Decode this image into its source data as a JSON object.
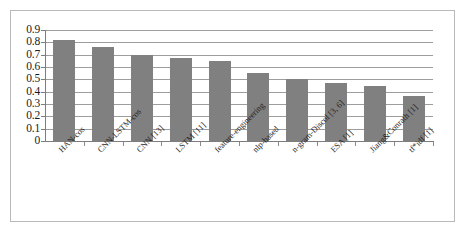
{
  "chart_data": {
    "type": "bar",
    "title": "",
    "subtitle": "",
    "xlabel": "",
    "ylabel": "",
    "ylim": [
      0,
      0.9
    ],
    "ytick_labels": [
      "0.9",
      "0.8",
      "0.7",
      "0.6",
      "0.5",
      "0.4",
      "0.3",
      "0.2",
      "0.1",
      "0"
    ],
    "ytick_values": [
      0.9,
      0.8,
      0.7,
      0.6,
      0.5,
      0.4,
      0.3,
      0.2,
      0.1,
      0
    ],
    "grid": "horizontal",
    "legend": "none",
    "bar_color": "#808080",
    "categories": [
      "HAN-cos",
      "CNN-LSTM-cos",
      "CNN [13]",
      "LSTM [11]",
      "feature-engineering",
      "nlp-based",
      "n-gram-Discol [3, 6]",
      "ESA [1]",
      "Jiang&Conrath [1]",
      "tf*idf [1]"
    ],
    "values": [
      0.82,
      0.76,
      0.7,
      0.67,
      0.645,
      0.55,
      0.5,
      0.47,
      0.45,
      0.365
    ]
  },
  "frame": {
    "border_color": "#b9b9b9",
    "background": "#ffffff"
  },
  "axes": {
    "axis_color": "#7d7d7d",
    "gridline_color": "#9d9d9d"
  }
}
